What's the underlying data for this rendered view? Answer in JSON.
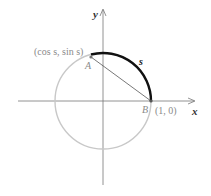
{
  "diagram": {
    "axes": {
      "x_label": "x",
      "y_label": "y"
    },
    "circle": {
      "type": "unit circle",
      "color": "#c8c8c8"
    },
    "arc": {
      "label": "s",
      "color": "#111111"
    },
    "points": {
      "A": {
        "label": "A",
        "coord_label": "(cos s, sin s)"
      },
      "B": {
        "label": "B",
        "coord_label": "(1, 0)"
      }
    },
    "chord": {
      "from": "A",
      "to": "B",
      "color": "#555555"
    }
  }
}
